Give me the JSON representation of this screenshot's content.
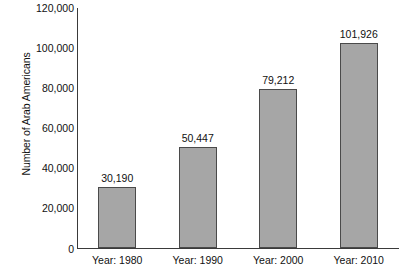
{
  "chart_data": {
    "type": "bar",
    "title": "",
    "subtitle": "",
    "xlabel": "",
    "ylabel": "Number of Arab Americans",
    "categories": [
      "Year: 1980",
      "Year: 1990",
      "Year: 2000",
      "Year: 2010"
    ],
    "values": [
      30190,
      50447,
      79212,
      101926
    ],
    "data_labels": [
      "30,190",
      "50,447",
      "79,212",
      "101,926"
    ],
    "ylim": [
      0,
      120000
    ],
    "ytick_values": [
      0,
      20000,
      40000,
      60000,
      80000,
      100000,
      120000
    ],
    "ytick_labels": [
      "0",
      "20,000",
      "40,000",
      "60,000",
      "80,000",
      "100,000",
      "120,000"
    ],
    "grid": false,
    "legend": null,
    "legend_position": "none",
    "bar_fill_color": "#a6a6a6",
    "bar_border_color": "#4a4a4a",
    "axis_color": "#3a3a3a",
    "text_color": "#111111",
    "background_color": "#ffffff"
  }
}
